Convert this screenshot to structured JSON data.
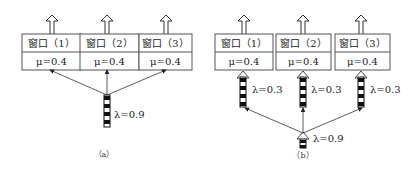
{
  "panels": [
    {
      "id": "a",
      "caption": "（a）",
      "windows": [
        {
          "title": "窗口（1）",
          "service_rate": "μ=0.4"
        },
        {
          "title": "窗口（2）",
          "service_rate": "μ=0.4"
        },
        {
          "title": "窗口（3）",
          "service_rate": "μ=0.4"
        }
      ],
      "arrival": {
        "label": "λ=0.9"
      },
      "sub_arrivals": []
    },
    {
      "id": "b",
      "caption": "（b）",
      "windows": [
        {
          "title": "窗口（1）",
          "service_rate": "μ=0.4"
        },
        {
          "title": "窗口（2）",
          "service_rate": "μ=0.4"
        },
        {
          "title": "窗口（3）",
          "service_rate": "μ=0.4"
        }
      ],
      "arrival": {
        "label": "λ=0.9"
      },
      "sub_arrivals": [
        {
          "label": "λ=0.3"
        },
        {
          "label": "λ=0.3"
        },
        {
          "label": "λ=0.3"
        }
      ]
    }
  ]
}
